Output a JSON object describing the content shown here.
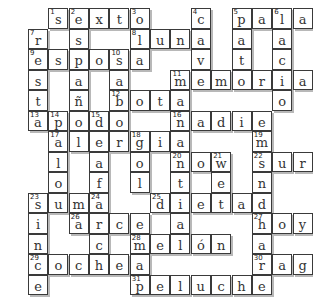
{
  "puzzle": {
    "cols": 14,
    "rows": 14,
    "cells": [
      {
        "r": 0,
        "c": 1,
        "l": "s",
        "n": "1"
      },
      {
        "r": 0,
        "c": 2,
        "l": "e",
        "n": "2"
      },
      {
        "r": 0,
        "c": 3,
        "l": "x"
      },
      {
        "r": 0,
        "c": 4,
        "l": "t"
      },
      {
        "r": 0,
        "c": 5,
        "l": "o",
        "n": "3"
      },
      {
        "r": 0,
        "c": 8,
        "l": "c",
        "n": "4"
      },
      {
        "r": 0,
        "c": 10,
        "l": "p",
        "n": "5"
      },
      {
        "r": 0,
        "c": 11,
        "l": "a"
      },
      {
        "r": 0,
        "c": 12,
        "l": "l",
        "n": "6"
      },
      {
        "r": 0,
        "c": 13,
        "l": "a"
      },
      {
        "r": 1,
        "c": 0,
        "l": "r",
        "n": "7"
      },
      {
        "r": 1,
        "c": 2,
        "l": "s"
      },
      {
        "r": 1,
        "c": 5,
        "l": "l",
        "n": "8"
      },
      {
        "r": 1,
        "c": 6,
        "l": "u"
      },
      {
        "r": 1,
        "c": 7,
        "l": "n"
      },
      {
        "r": 1,
        "c": 8,
        "l": "a"
      },
      {
        "r": 1,
        "c": 10,
        "l": "a"
      },
      {
        "r": 1,
        "c": 12,
        "l": "a"
      },
      {
        "r": 2,
        "c": 0,
        "l": "e",
        "n": "9"
      },
      {
        "r": 2,
        "c": 1,
        "l": "s"
      },
      {
        "r": 2,
        "c": 2,
        "l": "p"
      },
      {
        "r": 2,
        "c": 3,
        "l": "o"
      },
      {
        "r": 2,
        "c": 4,
        "l": "s",
        "n": "10"
      },
      {
        "r": 2,
        "c": 5,
        "l": "a"
      },
      {
        "r": 2,
        "c": 8,
        "l": "v"
      },
      {
        "r": 2,
        "c": 10,
        "l": "t"
      },
      {
        "r": 2,
        "c": 12,
        "l": "c"
      },
      {
        "r": 3,
        "c": 0,
        "l": "s"
      },
      {
        "r": 3,
        "c": 2,
        "l": "a"
      },
      {
        "r": 3,
        "c": 4,
        "l": "a"
      },
      {
        "r": 3,
        "c": 7,
        "l": "m",
        "n": "11"
      },
      {
        "r": 3,
        "c": 8,
        "l": "e"
      },
      {
        "r": 3,
        "c": 9,
        "l": "m"
      },
      {
        "r": 3,
        "c": 10,
        "l": "o"
      },
      {
        "r": 3,
        "c": 11,
        "l": "r"
      },
      {
        "r": 3,
        "c": 12,
        "l": "i"
      },
      {
        "r": 3,
        "c": 13,
        "l": "a"
      },
      {
        "r": 4,
        "c": 0,
        "l": "t"
      },
      {
        "r": 4,
        "c": 2,
        "l": "ñ"
      },
      {
        "r": 4,
        "c": 4,
        "l": "b",
        "n": "12"
      },
      {
        "r": 4,
        "c": 5,
        "l": "o"
      },
      {
        "r": 4,
        "c": 6,
        "l": "t"
      },
      {
        "r": 4,
        "c": 7,
        "l": "a"
      },
      {
        "r": 4,
        "c": 12,
        "l": "o"
      },
      {
        "r": 5,
        "c": 0,
        "l": "a",
        "n": "13"
      },
      {
        "r": 5,
        "c": 1,
        "l": "p",
        "n": "14"
      },
      {
        "r": 5,
        "c": 2,
        "l": "o"
      },
      {
        "r": 5,
        "c": 3,
        "l": "d",
        "n": "15"
      },
      {
        "r": 5,
        "c": 4,
        "l": "o"
      },
      {
        "r": 5,
        "c": 7,
        "l": "n",
        "n": "16"
      },
      {
        "r": 5,
        "c": 8,
        "l": "a"
      },
      {
        "r": 5,
        "c": 9,
        "l": "d"
      },
      {
        "r": 5,
        "c": 10,
        "l": "i"
      },
      {
        "r": 5,
        "c": 11,
        "l": "e"
      },
      {
        "r": 6,
        "c": 1,
        "l": "a",
        "n": "17"
      },
      {
        "r": 6,
        "c": 2,
        "l": "l"
      },
      {
        "r": 6,
        "c": 3,
        "l": "e"
      },
      {
        "r": 6,
        "c": 4,
        "l": "r"
      },
      {
        "r": 6,
        "c": 5,
        "l": "g",
        "n": "18"
      },
      {
        "r": 6,
        "c": 6,
        "l": "i"
      },
      {
        "r": 6,
        "c": 7,
        "l": "a"
      },
      {
        "r": 6,
        "c": 11,
        "l": "m",
        "n": "19"
      },
      {
        "r": 7,
        "c": 1,
        "l": "l"
      },
      {
        "r": 7,
        "c": 3,
        "l": "a"
      },
      {
        "r": 7,
        "c": 5,
        "l": "o"
      },
      {
        "r": 7,
        "c": 7,
        "l": "n",
        "n": "20"
      },
      {
        "r": 7,
        "c": 8,
        "l": "o"
      },
      {
        "r": 7,
        "c": 9,
        "l": "w",
        "n": "21"
      },
      {
        "r": 7,
        "c": 11,
        "l": "s",
        "n": "22"
      },
      {
        "r": 7,
        "c": 12,
        "l": "u"
      },
      {
        "r": 7,
        "c": 13,
        "l": "r"
      },
      {
        "r": 8,
        "c": 1,
        "l": "o"
      },
      {
        "r": 8,
        "c": 3,
        "l": "f"
      },
      {
        "r": 8,
        "c": 5,
        "l": "l"
      },
      {
        "r": 8,
        "c": 7,
        "l": "t"
      },
      {
        "r": 8,
        "c": 9,
        "l": "e"
      },
      {
        "r": 8,
        "c": 11,
        "l": "n"
      },
      {
        "r": 9,
        "c": 0,
        "l": "s",
        "n": "23"
      },
      {
        "r": 9,
        "c": 1,
        "l": "u"
      },
      {
        "r": 9,
        "c": 2,
        "l": "m"
      },
      {
        "r": 9,
        "c": 3,
        "l": "a",
        "n": "24"
      },
      {
        "r": 9,
        "c": 6,
        "l": "d",
        "n": "25"
      },
      {
        "r": 9,
        "c": 7,
        "l": "i"
      },
      {
        "r": 9,
        "c": 8,
        "l": "e"
      },
      {
        "r": 9,
        "c": 9,
        "l": "t"
      },
      {
        "r": 9,
        "c": 10,
        "l": "a"
      },
      {
        "r": 9,
        "c": 11,
        "l": "d"
      },
      {
        "r": 10,
        "c": 0,
        "l": "i"
      },
      {
        "r": 10,
        "c": 2,
        "l": "a",
        "n": "26"
      },
      {
        "r": 10,
        "c": 3,
        "l": "r"
      },
      {
        "r": 10,
        "c": 4,
        "l": "c"
      },
      {
        "r": 10,
        "c": 5,
        "l": "e"
      },
      {
        "r": 10,
        "c": 7,
        "l": "a"
      },
      {
        "r": 10,
        "c": 11,
        "l": "h",
        "n": "27"
      },
      {
        "r": 10,
        "c": 12,
        "l": "o"
      },
      {
        "r": 10,
        "c": 13,
        "l": "y"
      },
      {
        "r": 11,
        "c": 0,
        "l": "n"
      },
      {
        "r": 11,
        "c": 3,
        "l": "c"
      },
      {
        "r": 11,
        "c": 5,
        "l": "m",
        "n": "28"
      },
      {
        "r": 11,
        "c": 6,
        "l": "e"
      },
      {
        "r": 11,
        "c": 7,
        "l": "l"
      },
      {
        "r": 11,
        "c": 8,
        "l": "ó"
      },
      {
        "r": 11,
        "c": 9,
        "l": "n"
      },
      {
        "r": 11,
        "c": 11,
        "l": "a"
      },
      {
        "r": 12,
        "c": 0,
        "l": "c",
        "n": "29"
      },
      {
        "r": 12,
        "c": 1,
        "l": "o"
      },
      {
        "r": 12,
        "c": 2,
        "l": "c"
      },
      {
        "r": 12,
        "c": 3,
        "l": "h"
      },
      {
        "r": 12,
        "c": 4,
        "l": "e"
      },
      {
        "r": 12,
        "c": 5,
        "l": "a"
      },
      {
        "r": 12,
        "c": 11,
        "l": "r",
        "n": "30"
      },
      {
        "r": 12,
        "c": 12,
        "l": "a"
      },
      {
        "r": 12,
        "c": 13,
        "l": "g"
      },
      {
        "r": 13,
        "c": 0,
        "l": "e"
      },
      {
        "r": 13,
        "c": 5,
        "l": "p",
        "n": "31"
      },
      {
        "r": 13,
        "c": 6,
        "l": "e"
      },
      {
        "r": 13,
        "c": 7,
        "l": "l"
      },
      {
        "r": 13,
        "c": 8,
        "l": "u"
      },
      {
        "r": 13,
        "c": 9,
        "l": "c"
      },
      {
        "r": 13,
        "c": 10,
        "l": "h"
      },
      {
        "r": 13,
        "c": 11,
        "l": "e"
      }
    ],
    "words": {
      "across": [
        "sexto",
        "pala",
        "luna",
        "esposa",
        "memoria",
        "bota",
        "apodo",
        "nadie",
        "alergia",
        "now",
        "sur",
        "suma",
        "dieta",
        "arce",
        "hoy",
        "melón",
        "coche",
        "rag",
        "peluche"
      ],
      "down": [
        "sesta",
        "españa",
        "cavo",
        "patio",
        "lacio",
        "resto",
        "salsa",
        "pollo",
        "gol",
        "alfa",
        "noté",
        "mundo",
        "sinc",
        "acche",
        "diana",
        "maje"
      ]
    }
  }
}
